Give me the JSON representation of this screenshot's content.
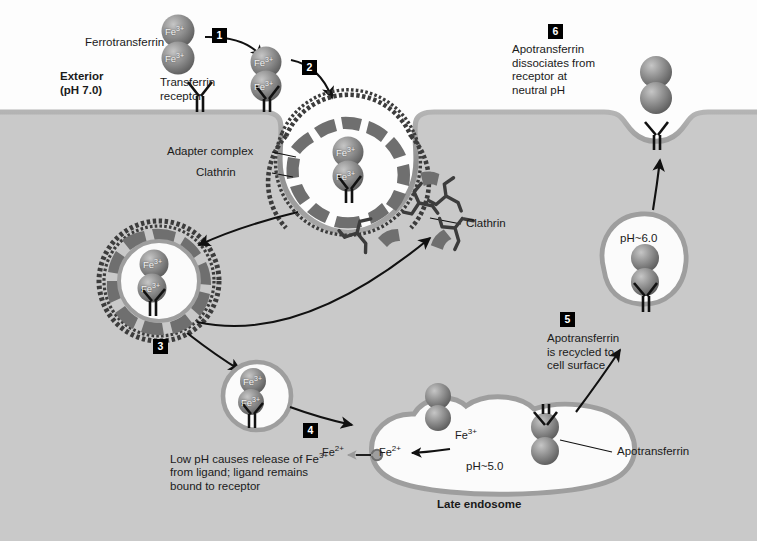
{
  "figure": {
    "type": "cell-biology-pathway-diagram",
    "width": 757,
    "height": 541
  },
  "colors": {
    "exterior_bg": "#fdfdfd",
    "cytosol_bg": "#c9c9c9",
    "membrane": "#9a9a9a",
    "vesicle_membrane": "#9e9e9e",
    "vesicle_lumen": "#fbfbfb",
    "clathrin": "#3c3c3c",
    "adapter": "#6f6f6f",
    "protein_sphere": "#8a8a8a",
    "badge_bg": "#000000",
    "badge_text": "#ffffff",
    "text": "#1a1a1a",
    "arrow": "#111111",
    "receptor": "#1a1a1a"
  },
  "compartments": {
    "exterior": {
      "name": "Exterior",
      "ph": "(pH 7.0)"
    },
    "cytosol": {
      "name": "Cytosol"
    }
  },
  "steps": [
    {
      "num": "1",
      "caption": ""
    },
    {
      "num": "2",
      "caption": ""
    },
    {
      "num": "3",
      "caption": ""
    },
    {
      "num": "4",
      "caption": "Low pH causes release of Fe3+\nfrom ligand; ligand remains\nbound to receptor"
    },
    {
      "num": "5",
      "caption": "Apotransferrin\nis recycled to\ncell surface"
    },
    {
      "num": "6",
      "caption": "Apotransferrin\ndissociates from\nreceptor at\nneutral pH"
    }
  ],
  "labels": {
    "ferrotransferrin": "Ferrotransferrin",
    "transferrin_receptor": "Transferrin\nreceptor",
    "adapter_complex": "Adapter complex",
    "clathrin_pit": "Clathrin",
    "clathrin_free": "Clathrin",
    "apotransferrin": "Apotransferrin",
    "late_endosome": "Late endosome",
    "step4_line1": "Low pH causes release of Fe",
    "step4_sup": "3+",
    "step4_line2": "from ligand; ligand remains",
    "step4_line3": "bound to receptor",
    "step5_line1": "Apotransferrin",
    "step5_line2": "is recycled to",
    "step5_line3": "cell surface",
    "step6_line1": "Apotransferrin",
    "step6_line2": "dissociates from",
    "step6_line3": "receptor at",
    "step6_line4": "neutral pH"
  },
  "ph_values": {
    "exterior": "(pH 7.0)",
    "recycling_endosome": "pH~6.0",
    "late_endosome": "pH~5.0"
  },
  "ions": {
    "ferric": "Fe",
    "ferric_sup": "3+",
    "ferrous": "Fe",
    "ferrous_sup": "2+"
  },
  "structures": [
    {
      "name": "ferrotransferrin-free",
      "ions": [
        "Fe3+",
        "Fe3+"
      ]
    },
    {
      "name": "ferrotransferrin-bound-receptor",
      "ions": [
        "Fe3+",
        "Fe3+"
      ]
    },
    {
      "name": "coated-pit",
      "ions": [
        "Fe3+",
        "Fe3+"
      ]
    },
    {
      "name": "coated-vesicle",
      "ions": [
        "Fe3+",
        "Fe3+"
      ]
    },
    {
      "name": "early-endosome",
      "ions": [
        "Fe3+",
        "Fe3+"
      ]
    },
    {
      "name": "late-endosome",
      "ph": "pH~5.0"
    },
    {
      "name": "recycling-endosome",
      "ph": "pH~6.0"
    },
    {
      "name": "apotransferrin-released",
      "ions": []
    }
  ]
}
